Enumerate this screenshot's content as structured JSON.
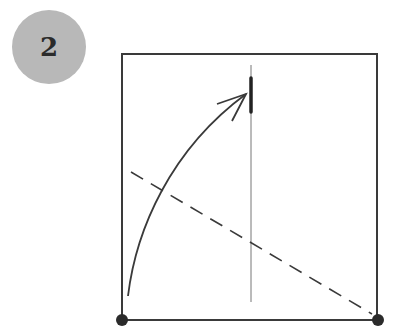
{
  "step": {
    "number": "2",
    "badge_color": "#b8b8b8"
  },
  "diagram": {
    "type": "fold-instruction",
    "square": {
      "x1": 122,
      "y1": 54,
      "x2": 377,
      "y2": 320,
      "stroke": "#3a3a3a"
    },
    "corner_dots": [
      {
        "name": "bottom-left",
        "x": 122,
        "y": 320
      },
      {
        "name": "bottom-right",
        "x": 378,
        "y": 320
      }
    ],
    "crease_line": {
      "x": 251,
      "y1": 65,
      "y2": 302
    },
    "landmark_mark": {
      "x": 251,
      "y1": 78,
      "y2": 112
    },
    "fold_line_dashed": {
      "x1": 131,
      "y1": 172,
      "x2": 372,
      "y2": 314
    },
    "fold_arrow": {
      "from": [
        128,
        296
      ],
      "to": [
        246,
        94
      ]
    }
  }
}
